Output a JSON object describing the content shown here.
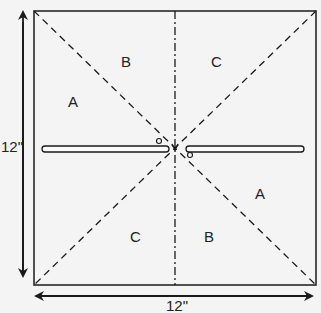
{
  "diagram": {
    "width_label": "12\"",
    "height_label": "12\"",
    "regions": [
      {
        "id": "a-left",
        "label": "A"
      },
      {
        "id": "b-top",
        "label": "B"
      },
      {
        "id": "c-top",
        "label": "C"
      },
      {
        "id": "a-right",
        "label": "A"
      },
      {
        "id": "c-bottom",
        "label": "C"
      },
      {
        "id": "b-bottom",
        "label": "B"
      }
    ],
    "colors": {
      "line": "#1a1a1a",
      "paper": "#f4f4f4"
    }
  }
}
